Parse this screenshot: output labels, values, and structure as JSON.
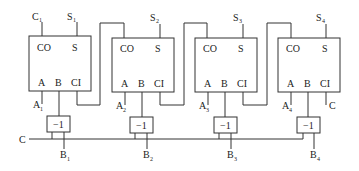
{
  "diagram": {
    "adders": [
      {
        "co": "CO",
        "s": "S",
        "a": "A",
        "b": "B",
        "ci": "CI",
        "top_left_label": "C",
        "top_left_sub": "1",
        "top_right_label": "S",
        "top_right_sub": "1",
        "a_in": "A",
        "a_sub": "1",
        "b_in": "B",
        "b_sub": "1",
        "neg": "−1"
      },
      {
        "co": "CO",
        "s": "S",
        "a": "A",
        "b": "B",
        "ci": "CI",
        "top_right_label": "S",
        "top_right_sub": "2",
        "a_in": "A",
        "a_sub": "2",
        "b_in": "B",
        "b_sub": "2",
        "neg": "−1"
      },
      {
        "co": "CO",
        "s": "S",
        "a": "A",
        "b": "B",
        "ci": "CI",
        "top_right_label": "S",
        "top_right_sub": "3",
        "a_in": "A",
        "a_sub": "3",
        "b_in": "B",
        "b_sub": "3",
        "neg": "−1"
      },
      {
        "co": "CO",
        "s": "S",
        "a": "A",
        "b": "B",
        "ci": "CI",
        "top_right_label": "S",
        "top_right_sub": "4",
        "a_in": "A",
        "a_sub": "4",
        "b_in": "B",
        "b_sub": "4",
        "neg": "−1"
      }
    ],
    "control_line_label": "C",
    "carry_in_label": "C",
    "colors": {
      "line": "#333333",
      "background": "#ffffff"
    }
  }
}
